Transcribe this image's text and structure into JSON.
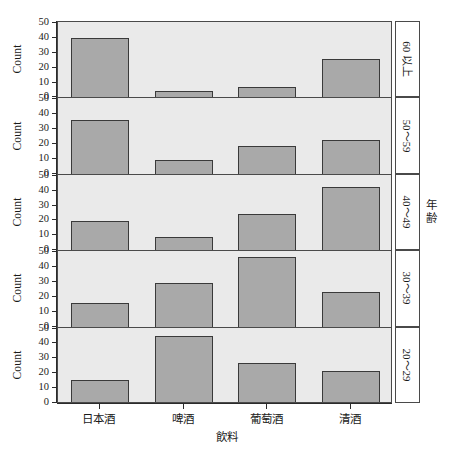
{
  "chart_data": {
    "type": "bar",
    "title": "",
    "subtitle": "",
    "xlabel": "飲料",
    "ylabel": "Count",
    "facet_label": "年齢",
    "ylim": [
      0,
      50
    ],
    "yticks": [
      0,
      10,
      20,
      30,
      40,
      50
    ],
    "grid": false,
    "legend": "none",
    "legend_position": "none",
    "orientation": "vertical",
    "layout": "faceted-vertical-stack",
    "categories": [
      "日本酒",
      "啤酒",
      "葡萄酒",
      "清酒"
    ],
    "facets": [
      {
        "label": "60 以上",
        "values": [
          40,
          4,
          7,
          25.5
        ]
      },
      {
        "label": "50〜59",
        "values": [
          36,
          9.5,
          18.5,
          22.5
        ]
      },
      {
        "label": "40〜49",
        "values": [
          19.5,
          9,
          24.5,
          42.5
        ]
      },
      {
        "label": "30〜39",
        "values": [
          16,
          29,
          47,
          23
        ]
      },
      {
        "label": "20〜29",
        "values": [
          14.5,
          44,
          26,
          21
        ]
      }
    ],
    "series": [
      {
        "name": "60 以上",
        "values": [
          40,
          4,
          7,
          25.5
        ]
      },
      {
        "name": "50〜59",
        "values": [
          36,
          9.5,
          18.5,
          22.5
        ]
      },
      {
        "name": "40〜49",
        "values": [
          19.5,
          9,
          24.5,
          42.5
        ]
      },
      {
        "name": "30〜39",
        "values": [
          16,
          29,
          47,
          23
        ]
      },
      {
        "name": "20〜29",
        "values": [
          14.5,
          44,
          26,
          21
        ]
      }
    ],
    "colors": {
      "panel_background": "#eaeaea",
      "bar_fill": "#a9a9a9",
      "bar_border": "#3a3a3a",
      "axis": "#2b2b2b",
      "page_background": "#ffffff",
      "strip_background": "#ffffff"
    }
  }
}
